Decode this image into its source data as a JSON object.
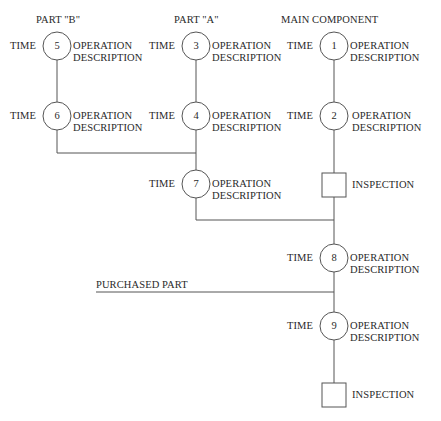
{
  "headers": {
    "part_b": "PART \"B\"",
    "part_a": "PART \"A\"",
    "main": "MAIN COMPONENT"
  },
  "time_label": "TIME",
  "operation": {
    "line1": "OPERATION",
    "line2": "DESCRIPTION"
  },
  "operations": [
    {
      "number": "1",
      "column": "main"
    },
    {
      "number": "2",
      "column": "main"
    },
    {
      "number": "3",
      "column": "part_a"
    },
    {
      "number": "4",
      "column": "part_a"
    },
    {
      "number": "5",
      "column": "part_b"
    },
    {
      "number": "6",
      "column": "part_b"
    },
    {
      "number": "7",
      "column": "part_a"
    },
    {
      "number": "8",
      "column": "main"
    },
    {
      "number": "9",
      "column": "main"
    }
  ],
  "inspection_label": "INSPECTION",
  "purchased_part_label": "PURCHASED PART",
  "colors": {
    "line": "#555555",
    "text": "#2a2a2a"
  }
}
